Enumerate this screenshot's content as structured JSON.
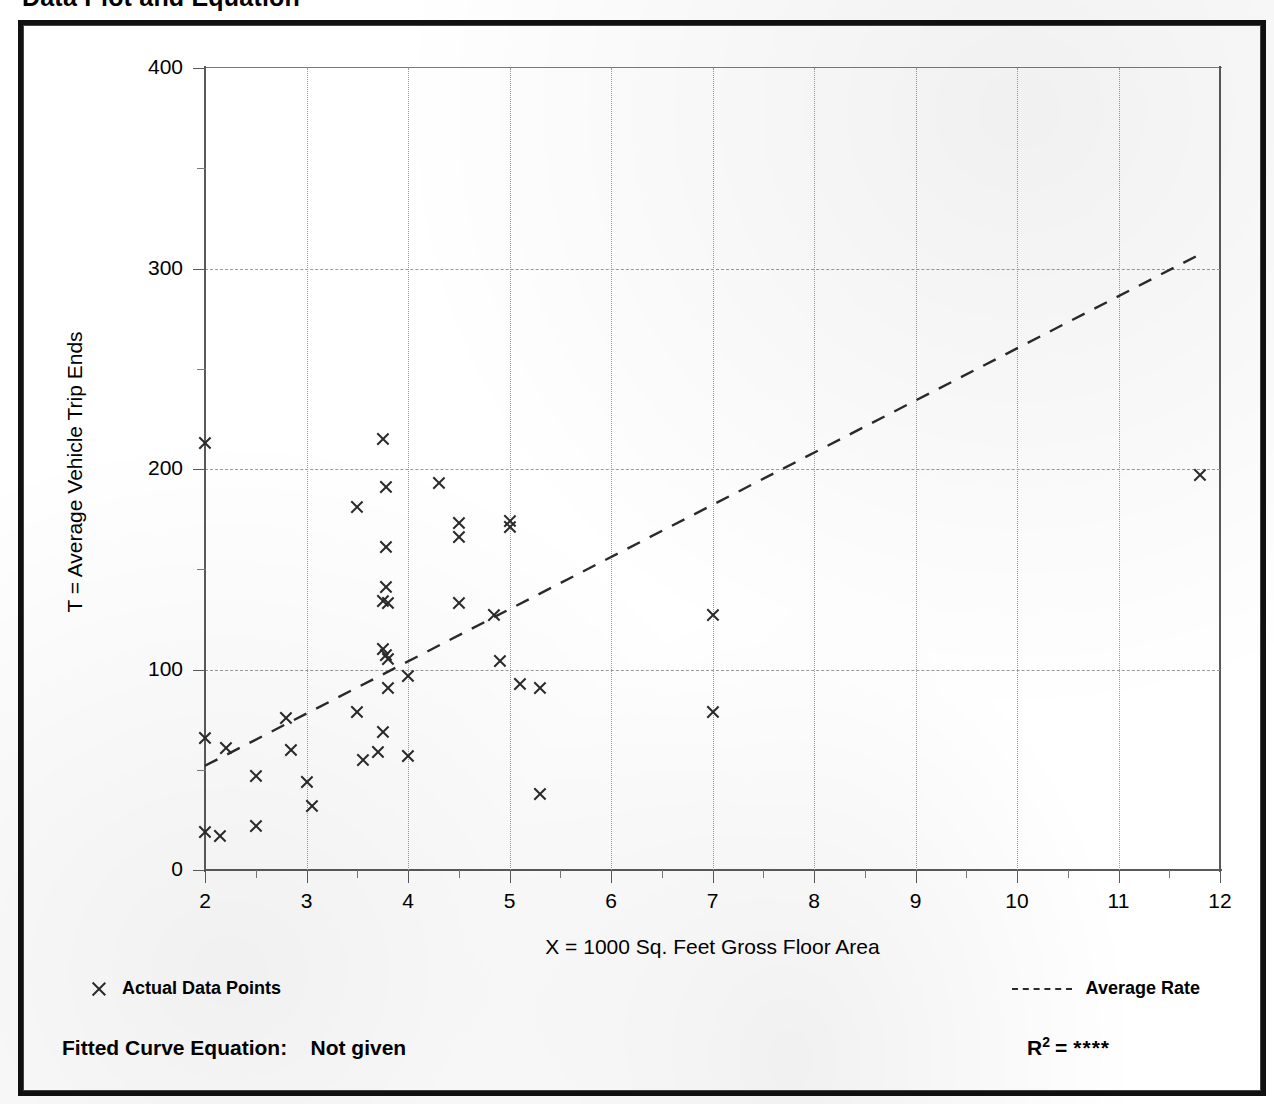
{
  "page": {
    "title": "Data Plot and Equation"
  },
  "chart_data": {
    "type": "scatter",
    "title": "Data Plot and Equation",
    "xlabel": "X = 1000 Sq. Feet Gross Floor Area",
    "ylabel": "T = Average Vehicle Trip Ends",
    "xlim": [
      2,
      12
    ],
    "ylim": [
      0,
      400
    ],
    "xticks": [
      2,
      3,
      4,
      5,
      6,
      7,
      8,
      9,
      10,
      11,
      12
    ],
    "yticks": [
      0,
      100,
      200,
      300,
      400
    ],
    "x_minor_tick_step": 0.5,
    "y_minor_tick_step": 50,
    "grid": "dotted vertical at integers, dashed horizontal at 100s",
    "legend_position": "below plot, left and right",
    "legend": [
      {
        "marker": "x",
        "label": "Actual Data Points"
      },
      {
        "marker": "dashed-line",
        "label": "Average Rate"
      }
    ],
    "series": [
      {
        "name": "Actual Data Points",
        "marker": "x",
        "points": [
          [
            2.0,
            213
          ],
          [
            2.0,
            66
          ],
          [
            2.0,
            19
          ],
          [
            2.15,
            17
          ],
          [
            2.2,
            61
          ],
          [
            2.5,
            47
          ],
          [
            2.5,
            22
          ],
          [
            2.8,
            76
          ],
          [
            2.85,
            60
          ],
          [
            3.0,
            44
          ],
          [
            3.05,
            32
          ],
          [
            3.5,
            181
          ],
          [
            3.5,
            79
          ],
          [
            3.55,
            55
          ],
          [
            3.75,
            215
          ],
          [
            3.78,
            191
          ],
          [
            3.78,
            161
          ],
          [
            3.78,
            141
          ],
          [
            3.75,
            134
          ],
          [
            3.8,
            133
          ],
          [
            3.75,
            110
          ],
          [
            3.78,
            107
          ],
          [
            3.8,
            105
          ],
          [
            3.8,
            91
          ],
          [
            3.75,
            69
          ],
          [
            3.7,
            59
          ],
          [
            4.0,
            97
          ],
          [
            4.0,
            57
          ],
          [
            4.3,
            193
          ],
          [
            4.5,
            173
          ],
          [
            4.5,
            166
          ],
          [
            4.5,
            133
          ],
          [
            4.85,
            127
          ],
          [
            4.9,
            104
          ],
          [
            5.0,
            174
          ],
          [
            5.0,
            171
          ],
          [
            5.1,
            93
          ],
          [
            5.3,
            91
          ],
          [
            5.3,
            38
          ],
          [
            7.0,
            127
          ],
          [
            7.0,
            79
          ],
          [
            11.8,
            197
          ]
        ]
      },
      {
        "name": "Average Rate",
        "type": "line",
        "style": "dashed",
        "endpoints": [
          [
            2.0,
            52
          ],
          [
            11.8,
            307
          ]
        ]
      }
    ]
  },
  "footer": {
    "fitted_equation_label": "Fitted Curve Equation:",
    "fitted_equation_value": "Not given",
    "r2_label": "R",
    "r2_exponent": "2",
    "r2_equals": "=",
    "r2_value": "****"
  },
  "colors": {
    "ink": "#000000",
    "marker": "#2b2b2b",
    "axis": "#5a5a5a",
    "grid": "#9a9a9a",
    "frame": "#111111"
  }
}
